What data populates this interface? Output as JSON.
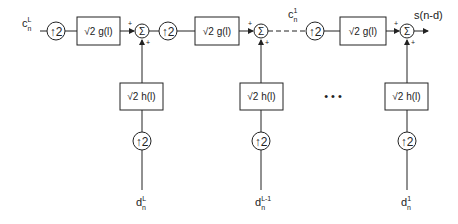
{
  "diagram": {
    "inputs_top": {
      "c_L": {
        "base": "c",
        "sub": "n",
        "sup": "L"
      },
      "c_1": {
        "base": "c",
        "sub": "n",
        "sup": "1"
      }
    },
    "inputs_bottom": [
      {
        "base": "d",
        "sub": "n",
        "sup": "L"
      },
      {
        "base": "d",
        "sub": "n",
        "sup": "L-1"
      },
      {
        "base": "d",
        "sub": "n",
        "sup": "1"
      }
    ],
    "upsampler_label": "2",
    "g_block_label": "√2 g(l)",
    "h_block_label": "√2 h(l)",
    "sum_symbol": "Σ",
    "plus_sign": "+",
    "ellipsis": "• • •",
    "output_label": "s(n-d)"
  }
}
